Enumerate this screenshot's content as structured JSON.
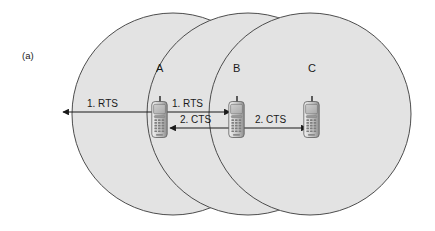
{
  "figure": {
    "panel_label": "(a)",
    "background_color": "#ffffff",
    "circle_fill": "#e3e3e3",
    "circle_stroke": "#4d4d4d",
    "line_color": "#1a1a1a"
  },
  "coverage_circles": [
    {
      "name": "circle-left",
      "cx": 173,
      "cy": 114,
      "r": 101
    },
    {
      "name": "circle-middle",
      "cx": 248,
      "cy": 114,
      "r": 101
    },
    {
      "name": "circle-right",
      "cx": 310,
      "cy": 114,
      "r": 101
    }
  ],
  "nodes": [
    {
      "id": "A",
      "label": "A",
      "label_x": 156,
      "label_y": 62,
      "phone_x": 151,
      "phone_y": 96
    },
    {
      "id": "B",
      "label": "B",
      "label_x": 233,
      "label_y": 62,
      "phone_x": 228,
      "phone_y": 96
    },
    {
      "id": "C",
      "label": "C",
      "label_x": 308,
      "label_y": 62,
      "phone_x": 303,
      "phone_y": 96
    }
  ],
  "messages": [
    {
      "name": "rts-left-broadcast",
      "label": "1. RTS",
      "label_x": 87,
      "label_y": 98,
      "x1": 161,
      "y1": 112,
      "x2": 63,
      "y2": 112,
      "arrow_start": false,
      "arrow_end": true
    },
    {
      "name": "rts-a-to-b",
      "label": "1. RTS",
      "label_x": 172,
      "label_y": 98,
      "x1": 161,
      "y1": 112,
      "x2": 230,
      "y2": 112,
      "arrow_start": false,
      "arrow_end": true
    },
    {
      "name": "cts-b-to-a",
      "label": "2. CTS",
      "label_x": 180,
      "label_y": 114,
      "x1": 237,
      "y1": 128,
      "x2": 170,
      "y2": 128,
      "arrow_start": false,
      "arrow_end": true
    },
    {
      "name": "cts-b-to-c",
      "label": "2. CTS",
      "label_x": 255,
      "label_y": 114,
      "x1": 237,
      "y1": 128,
      "x2": 307,
      "y2": 128,
      "arrow_start": false,
      "arrow_end": true
    }
  ]
}
